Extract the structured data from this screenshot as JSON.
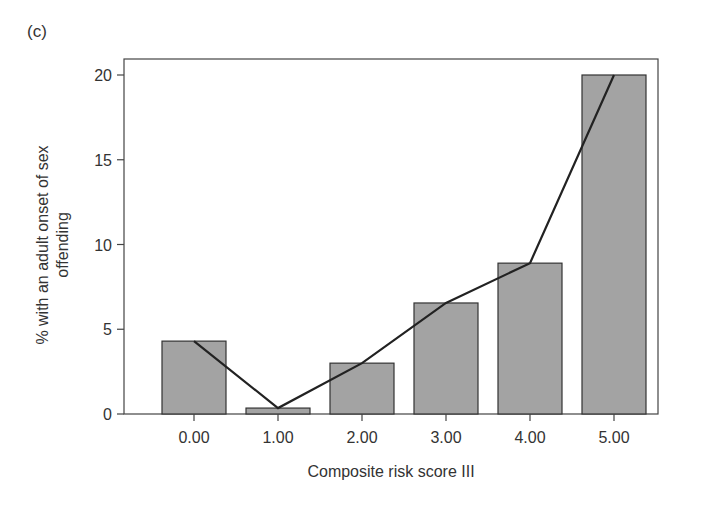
{
  "panel_label": "(c)",
  "chart_data": {
    "type": "bar",
    "title": "",
    "xlabel": "Composite risk score III",
    "ylabel_lines": [
      "% with an adult onset of sex",
      "offending"
    ],
    "ylabel": "% with an adult onset of sex offending",
    "categories": [
      "0.00",
      "1.00",
      "2.00",
      "3.00",
      "4.00",
      "5.00"
    ],
    "values": [
      4.3,
      0.35,
      3.0,
      6.55,
      8.9,
      20.0
    ],
    "overlay_line": {
      "type": "line",
      "values": [
        4.3,
        0.35,
        3.0,
        6.55,
        8.9,
        20.0
      ]
    },
    "ylim": [
      0,
      20.9
    ],
    "yticks": [
      0,
      5,
      10,
      15,
      20
    ],
    "grid": false,
    "legend": null,
    "colors": {
      "bar_fill": "#a3a3a3",
      "bar_stroke": "#333333",
      "line": "#222222",
      "axis": "#444444"
    }
  }
}
